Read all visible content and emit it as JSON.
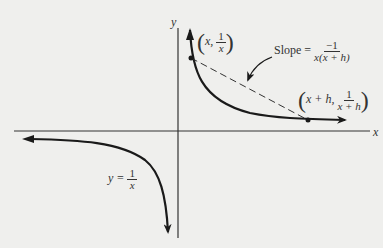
{
  "diagram": {
    "axes": {
      "x_label": "x",
      "y_label": "y"
    },
    "curve_label": {
      "lhs": "y =",
      "num": "1",
      "den": "x"
    },
    "point1": {
      "x": "x,",
      "num": "1",
      "den": "x"
    },
    "point2": {
      "x": "x + h,",
      "num": "1",
      "den": "x + h"
    },
    "slope": {
      "label": "Slope =",
      "num": "−1",
      "den": "x(x + h)"
    },
    "colors": {
      "ink": "#1a1a1a",
      "background": "#efefed"
    }
  }
}
